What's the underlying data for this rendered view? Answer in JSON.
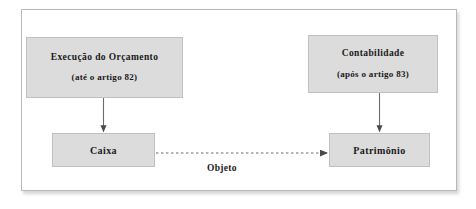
{
  "diagram": {
    "nodes": [
      {
        "id": "execucao",
        "line1": "Execução do Orçamento",
        "line2": "(até o artigo 82)"
      },
      {
        "id": "contabilidade",
        "line1": "Contabilidade",
        "line2": "(após o artigo 83)"
      },
      {
        "id": "caixa",
        "line1": "Caixa"
      },
      {
        "id": "patrimonio",
        "line1": "Patrimônio"
      }
    ],
    "edges": [
      {
        "id": "execucao-to-caixa",
        "from": "execucao",
        "to": "caixa",
        "style": "solid",
        "label": ""
      },
      {
        "id": "contabilidade-to-patrimonio",
        "from": "contabilidade",
        "to": "patrimonio",
        "style": "solid",
        "label": ""
      },
      {
        "id": "caixa-to-patrimonio",
        "from": "caixa",
        "to": "patrimonio",
        "style": "dashed",
        "label": "Objeto"
      }
    ],
    "colors": {
      "node_fill": "#dcdcdc",
      "node_border": "#c0c0c0",
      "frame_border": "#b9b9b9",
      "connector": "#555555",
      "text": "#1a1a1a",
      "background": "#ffffff"
    }
  }
}
